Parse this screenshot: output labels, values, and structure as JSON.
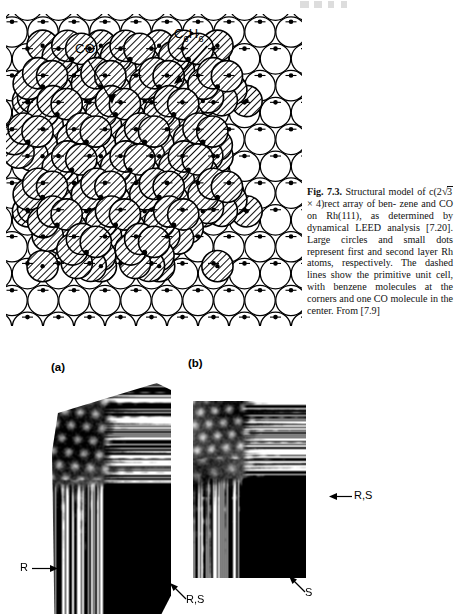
{
  "figure": {
    "number": "7.3",
    "label_bold": "Fig. 7.3.",
    "caption_part1": "Structural model of",
    "caption_line2_pre": "c(2",
    "caption_radical": "3",
    "caption_line2_post": " × 4)rect array of ben-",
    "caption_rest": "zene and CO on Rh(111), as determined by dynamical LEED analysis [7.20]. Large circles and small dots represent first and second layer Rh atoms, respectively. The dashed lines show the primitive unit cell, with benzene molecules at the corners and one CO molecule in the center. From [7.9]",
    "caption_full": "Fig. 7.3. Structural model of c(2√3 × 4)rect array of benzene and CO on Rh(111), as determined by dynamical LEED analysis [7.20]. Large circles and small dots represent first and second layer Rh atoms, respectively. The dashed lines show the primitive unit cell, with benzene molecules at the corners and one CO molecule in the center. From [7.9]"
  },
  "model": {
    "label_co": "CO",
    "label_benzene_main": "C",
    "label_benzene_sub1": "6",
    "label_benzene_mid": "H",
    "label_benzene_sub2": "6",
    "label_benzene_full": "C6H6",
    "substrate": "Rh(111)",
    "adsorbates": [
      "benzene",
      "CO"
    ],
    "colors": {
      "outline": "#000000",
      "open_circle_fill": "#ffffff",
      "hatch": "#000000",
      "background": "#ffffff"
    }
  },
  "panels": [
    {
      "id": "a",
      "label": "(a)",
      "annotations": [
        {
          "name": "r-arrow-left",
          "text": "R",
          "direction": "right"
        },
        {
          "name": "rs-arrow-bottom",
          "text": "R,S",
          "direction": "up-left"
        }
      ]
    },
    {
      "id": "b",
      "label": "(b)",
      "annotations": [
        {
          "name": "rs-arrow-right",
          "text": "R,S",
          "direction": "left"
        },
        {
          "name": "s-arrow-bottom",
          "text": "S",
          "direction": "up-left"
        }
      ]
    }
  ],
  "annotations": {
    "r": "R",
    "rs": "R,S",
    "s": "S"
  }
}
